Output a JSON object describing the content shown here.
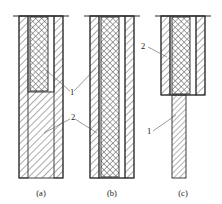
{
  "figure": {
    "title": "",
    "background_color": "#ffffff",
    "line_color": "#2b2b2b",
    "leader_color": "#555555",
    "hatch_wall_color": "#6a6a6a",
    "hatch_core_color": "#555555"
  },
  "panels": [
    {
      "id": "a",
      "caption": "(a)",
      "caption_x": 41,
      "caption_y": 196,
      "cap_line": {
        "x1": 13,
        "x2": 69,
        "y": 16
      },
      "tube": {
        "x": 19,
        "y": 16,
        "width": 44,
        "height": 162
      },
      "wall_thickness": 9,
      "core": {
        "x": 30,
        "y": 17,
        "width": 18,
        "height": 74,
        "pattern": "cross-hatch"
      },
      "core_extent": "partial-top"
    },
    {
      "id": "b",
      "caption": "(b)",
      "caption_x": 112,
      "caption_y": 196,
      "cap_line": {
        "x1": 84,
        "x2": 140,
        "y": 16
      },
      "tube": {
        "x": 90,
        "y": 16,
        "width": 44,
        "height": 162
      },
      "wall_thickness": 9,
      "core": {
        "x": 101,
        "y": 17,
        "width": 18,
        "height": 160,
        "pattern": "cross-hatch"
      },
      "core_extent": "full-length"
    },
    {
      "id": "c",
      "caption": "(c)",
      "caption_x": 183,
      "caption_y": 196,
      "cap_line": {
        "x1": 155,
        "x2": 211,
        "y": 16
      },
      "tube": {
        "x": 161,
        "y": 16,
        "width": 44,
        "height": 79
      },
      "wall_thickness": 9,
      "core": {
        "x": 172,
        "y": 17,
        "width": 18,
        "height": 77,
        "pattern": "cross-hatch"
      },
      "stem": {
        "x": 172,
        "y": 95,
        "width": 14,
        "height": 83,
        "pattern": "diagonal-hatch"
      },
      "core_extent": "upper-section-with-stem"
    }
  ],
  "callouts": [
    {
      "label": "1",
      "panel": "ab",
      "text_x": 70,
      "text_y": 95,
      "leaders": [
        {
          "x1": 74,
          "y1": 91,
          "x2": 96,
          "y2": 68
        },
        {
          "x1": 70,
          "y1": 91,
          "x2": 46,
          "y2": 70
        }
      ],
      "points_to": "inner cross-hatched core"
    },
    {
      "label": "2",
      "panel": "ab",
      "text_x": 71,
      "text_y": 120,
      "leaders": [
        {
          "x1": 75,
          "y1": 119,
          "x2": 97,
          "y2": 133
        },
        {
          "x1": 70,
          "y1": 119,
          "x2": 44,
          "y2": 133
        }
      ],
      "points_to": "outer diagonally hatched wall"
    },
    {
      "label": "2",
      "panel": "c",
      "text_x": 141,
      "text_y": 49,
      "leaders": [
        {
          "x1": 148,
          "y1": 47,
          "x2": 167,
          "y2": 57
        }
      ],
      "points_to": "outer diagonally hatched wall"
    },
    {
      "label": "1",
      "panel": "c",
      "text_x": 147,
      "text_y": 134,
      "leaders": [
        {
          "x1": 153,
          "y1": 131,
          "x2": 176,
          "y2": 115
        }
      ],
      "points_to": "lower stem"
    }
  ]
}
